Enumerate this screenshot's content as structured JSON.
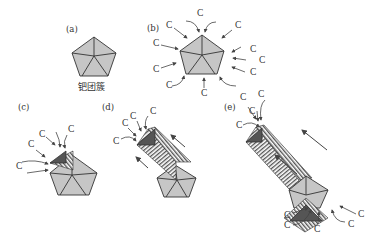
{
  "figure": {
    "panels": [
      {
        "id": "a",
        "label": "(a)",
        "caption": "钯团簇"
      },
      {
        "id": "b",
        "label": "(b)",
        "atom_labels": [
          "C",
          "C",
          "C",
          "C",
          "C",
          "C",
          "C",
          "C",
          "C",
          "C"
        ]
      },
      {
        "id": "c",
        "label": "(c)",
        "atom_labels": [
          "C",
          "C",
          "C",
          "C"
        ]
      },
      {
        "id": "d",
        "label": "(d)",
        "atom_labels": [
          "C",
          "C",
          "C",
          "C"
        ]
      },
      {
        "id": "e",
        "label": "(e)",
        "atom_labels": [
          "C",
          "C",
          "C",
          "C",
          "C",
          "C",
          "C",
          "C",
          "C"
        ]
      }
    ],
    "colors": {
      "facet_fill": "#c6c6c6",
      "growth_face": "#555555",
      "edge": "#333333",
      "background": "#ffffff"
    }
  }
}
